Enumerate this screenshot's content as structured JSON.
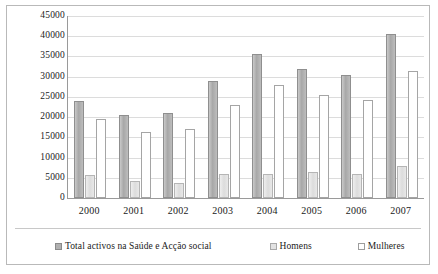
{
  "chart_data": {
    "type": "bar",
    "title": "",
    "subtitle": "",
    "xlabel": "",
    "ylabel": "",
    "categories": [
      "2000",
      "2001",
      "2002",
      "2003",
      "2004",
      "2005",
      "2006",
      "2007"
    ],
    "series": [
      {
        "name": "Total activos na Saúde e Acção social",
        "swatch": "total",
        "values": [
          24000,
          20500,
          21000,
          29000,
          35500,
          32000,
          30500,
          40500
        ]
      },
      {
        "name": "Homens",
        "swatch": "homens",
        "values": [
          5800,
          4200,
          3800,
          6000,
          6000,
          6500,
          6000,
          7800
        ]
      },
      {
        "name": "Mulheres",
        "swatch": "mulheres",
        "values": [
          19500,
          16200,
          17000,
          23000,
          28000,
          25500,
          24200,
          31500
        ]
      }
    ],
    "ylim": [
      0,
      45000
    ],
    "ytick_step": 5000,
    "yticks": [
      0,
      5000,
      10000,
      15000,
      20000,
      25000,
      30000,
      35000,
      40000,
      45000
    ],
    "ytick_labels": [
      "0",
      "5000",
      "10000",
      "15000",
      "20000",
      "25000",
      "30000",
      "35000",
      "40000",
      "45000"
    ],
    "grid": true,
    "legend_position": "bottom",
    "colors": {
      "total": "#b0b0b0",
      "homens": "#e2e2e2",
      "mulheres": "#ffffff",
      "gridline": "#dcdcdc",
      "axis": "#9a9a9a",
      "frame": "#b9b9b9",
      "text": "#1a1a1a"
    }
  }
}
